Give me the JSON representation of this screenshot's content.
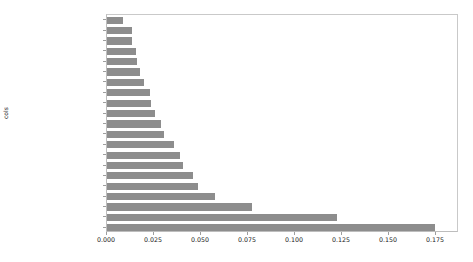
{
  "chart_data": {
    "type": "bar",
    "orientation": "horizontal",
    "title": "",
    "xlabel": "",
    "ylabel": "cols",
    "grid": false,
    "legend": false,
    "xlim": [
      0.0,
      0.1872
    ],
    "xticks": [
      0.0,
      0.025,
      0.05,
      0.075,
      0.1,
      0.125,
      0.15,
      0.175
    ],
    "xtick_labels": [
      "0.000",
      "0.025",
      "0.050",
      "0.075",
      "0.100",
      "0.125",
      "0.150",
      "0.175"
    ],
    "categories": [
      "Drive_System",
      "ProductGroup",
      "ProductGroupDesc",
      "Tire_Size",
      "MachineID",
      "fiModelDescriptor",
      "Hydraulics",
      "saleYear",
      "fiBaseModel",
      "SalesID",
      "fiModelDesc",
      "Enclosure",
      "fiSecondaryDesc",
      "saleElapsed",
      "ModelID",
      "Hydraulics_Flow",
      "Coupler_System",
      "Grouser_Tracks",
      "fiProductClassDesc",
      "ProductSize",
      "YearMade"
    ],
    "values": [
      0.0085,
      0.0133,
      0.0133,
      0.0154,
      0.0159,
      0.0175,
      0.0196,
      0.0228,
      0.0234,
      0.0255,
      0.0287,
      0.0303,
      0.0356,
      0.0388,
      0.0404,
      0.0457,
      0.0484,
      0.0574,
      0.0771,
      0.1223,
      0.1745
    ],
    "bar_color": "#8d8d8d"
  }
}
